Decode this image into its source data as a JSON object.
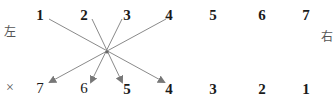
{
  "diagram": {
    "left_label": "左",
    "right_label": "右",
    "cross_mark": "×",
    "top_row": [
      "1",
      "2",
      "3",
      "4",
      "5",
      "6",
      "7"
    ],
    "bottom_row": [
      "7",
      "6",
      "5",
      "4",
      "3",
      "2",
      "1"
    ],
    "connections": [
      {
        "from_top": "1",
        "to_bottom": "4"
      },
      {
        "from_top": "2",
        "to_bottom": "5"
      },
      {
        "from_top": "3",
        "to_bottom": "6"
      },
      {
        "from_top": "4",
        "to_bottom": "7"
      }
    ],
    "line_color": "#808080"
  }
}
